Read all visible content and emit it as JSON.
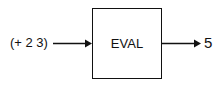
{
  "diagram": {
    "input": {
      "label": "(+ 2 3)"
    },
    "process": {
      "label": "EVAL"
    },
    "output": {
      "label": "5"
    },
    "edges": [
      {
        "from": "input",
        "to": "process"
      },
      {
        "from": "process",
        "to": "output"
      }
    ]
  }
}
